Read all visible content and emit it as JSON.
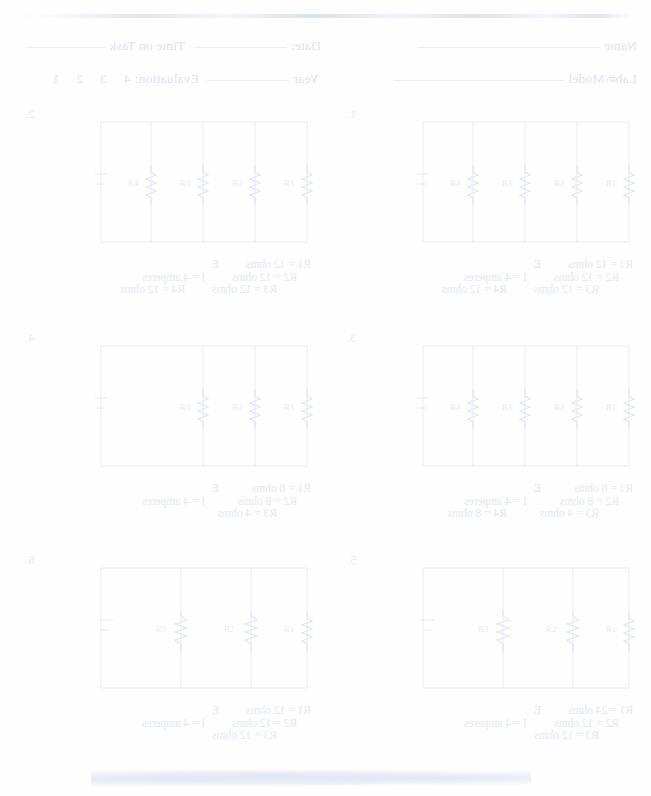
{
  "document": {
    "kind": "worksheet-scan",
    "appearance": "mirrored faded scan, blue-grey ink on white paper",
    "ink_color": "#e3e7f2"
  },
  "header": {
    "name_label": "Name",
    "date_label": "Date:",
    "time_on_task_label": "Time on Task",
    "lab_model_label": "Lab#/Model",
    "year_label": "Year",
    "evaluation_label": "Evaluation:",
    "evaluation_options": "4  3  2  1"
  },
  "problems": [
    {
      "number": "1.",
      "resistor_count": 4,
      "source_label": "E",
      "current_label": "I = 4 amperes",
      "values": [
        {
          "left": "R1 = 12 ohms",
          "right": ""
        },
        {
          "left": "R2 = 12 ohms",
          "right": ""
        },
        {
          "left": "R3 = 12 ohms",
          "right": "R4 = 12 ohms"
        }
      ],
      "resistor_tags": [
        "R1",
        "R2",
        "R3",
        "R4"
      ]
    },
    {
      "number": "2.",
      "resistor_count": 4,
      "source_label": "E",
      "current_label": "I = 4 amperes",
      "values": [
        {
          "left": "R1 = 12 ohms",
          "right": ""
        },
        {
          "left": "R2 = 12 ohms",
          "right": ""
        },
        {
          "left": "R3 = 12 ohms",
          "right": "R4 = 12 ohms"
        }
      ],
      "resistor_tags": [
        "R1",
        "R2",
        "R3",
        "R4"
      ]
    },
    {
      "number": "3.",
      "resistor_count": 4,
      "source_label": "E",
      "current_label": "I = 4 amperes",
      "values": [
        {
          "left": "R1 = 8 ohms",
          "right": ""
        },
        {
          "left": "R2 = 8 ohms",
          "right": ""
        },
        {
          "left": "R3 = 4 ohms",
          "right": "R4 = 8 ohms"
        }
      ],
      "resistor_tags": [
        "R1",
        "R2",
        "R3",
        "R4"
      ]
    },
    {
      "number": "4.",
      "resistor_count": 3,
      "source_label": "E",
      "current_label": "I = 4 amperes",
      "values": [
        {
          "left": "R1 = 8 ohms",
          "right": ""
        },
        {
          "left": "R2 = 8 ohms",
          "right": ""
        },
        {
          "left": "R3 = 4 ohms",
          "right": ""
        }
      ],
      "resistor_tags": [
        "R1",
        "R2",
        "R3"
      ]
    },
    {
      "number": "5.",
      "resistor_count": 3,
      "source_label": "E",
      "current_label": "I = 4 amperes",
      "values": [
        {
          "left": "R1 = 24 ohms",
          "right": ""
        },
        {
          "left": "R2 = 12 ohms",
          "right": ""
        },
        {
          "left": "R3 = 12 ohms",
          "right": ""
        }
      ],
      "resistor_tags": [
        "R1",
        "R2",
        "R3"
      ]
    },
    {
      "number": "6.",
      "resistor_count": 3,
      "source_label": "E",
      "current_label": "I = 4 amperes",
      "values": [
        {
          "left": "R1 = 12 ohms",
          "right": ""
        },
        {
          "left": "R2 = 12 ohms",
          "right": ""
        },
        {
          "left": "R3 = 12 ohms",
          "right": ""
        }
      ],
      "resistor_tags": [
        "R1",
        "R2",
        "R3"
      ]
    }
  ]
}
